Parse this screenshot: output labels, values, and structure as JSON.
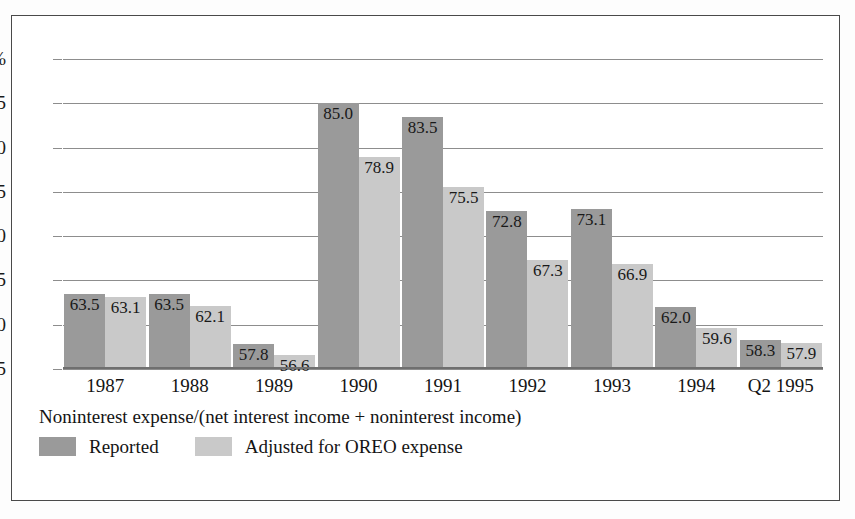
{
  "chart_data": {
    "type": "bar",
    "title": "",
    "subtitle": "",
    "caption": "Noninterest expense/(net interest income + noninterest income)",
    "xlabel": "",
    "ylabel": "",
    "ylim": [
      55,
      90
    ],
    "grid": true,
    "legend_position": "bottom-left",
    "categories": [
      "1987",
      "1988",
      "1989",
      "1990",
      "1991",
      "1992",
      "1993",
      "1994",
      "Q2 1995"
    ],
    "y_axis": {
      "ticks": [
        90,
        85,
        80,
        75,
        70,
        65,
        60,
        55
      ],
      "tick_labels": [
        "90%",
        "85",
        "80",
        "75",
        "70",
        "65",
        "50",
        "55"
      ]
    },
    "series": [
      {
        "name": "Reported",
        "color": "#9a9a9a",
        "values": [
          63.5,
          63.5,
          57.8,
          85.0,
          83.5,
          72.8,
          73.1,
          62.0,
          58.3
        ],
        "value_labels": [
          "63.5",
          "63.5",
          "57.8",
          "85.0",
          "83.5",
          "72.8",
          "73.1",
          "62.0",
          "58.3"
        ]
      },
      {
        "name": "Adjusted for OREO expense",
        "color": "#c9c9c9",
        "values": [
          63.1,
          62.1,
          56.6,
          78.9,
          75.5,
          67.3,
          66.9,
          59.6,
          57.9
        ],
        "value_labels": [
          "63.1",
          "62.1",
          "56.6",
          "78.9",
          "75.5",
          "67.3",
          "66.9",
          "59.6",
          "57.9"
        ]
      }
    ]
  },
  "legend": {
    "items": [
      {
        "label": "Reported",
        "color": "#9a9a9a"
      },
      {
        "label": "Adjusted for OREO expense",
        "color": "#c9c9c9"
      }
    ]
  }
}
